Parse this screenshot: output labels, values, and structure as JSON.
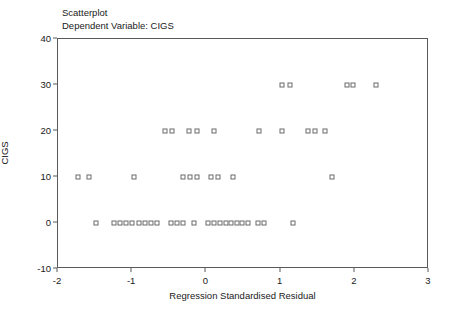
{
  "chart_data": {
    "type": "scatter",
    "title": "Scatterplot",
    "subtitle": "Dependent Variable: CIGS",
    "xlabel": "Regression Standardised Residual",
    "ylabel": "CIGS",
    "xlim": [
      -2,
      3
    ],
    "ylim": [
      -10,
      40
    ],
    "xticks": [
      -2,
      -1,
      0,
      1,
      2,
      3
    ],
    "xticklabels": [
      "-2",
      "-1",
      "0",
      "1",
      "2",
      "3"
    ],
    "yticks": [
      -10,
      0,
      10,
      20,
      30,
      40
    ],
    "yticklabels": [
      "-10",
      "0",
      "10",
      "20",
      "30",
      "40"
    ],
    "grid": false,
    "legend": null,
    "marker": "open-square",
    "marker_color": "#6b6b6b",
    "series": [
      {
        "name": "CIGS vs Regression Standardised Residual",
        "points": [
          [
            1.02,
            30
          ],
          [
            1.12,
            30
          ],
          [
            1.89,
            30
          ],
          [
            1.98,
            30
          ],
          [
            2.28,
            30
          ],
          [
            -0.56,
            20
          ],
          [
            -0.47,
            20
          ],
          [
            -0.24,
            20
          ],
          [
            -0.13,
            20
          ],
          [
            0.1,
            20
          ],
          [
            0.71,
            20
          ],
          [
            1.02,
            20
          ],
          [
            1.37,
            20
          ],
          [
            1.46,
            20
          ],
          [
            1.6,
            20
          ],
          [
            -1.73,
            10
          ],
          [
            -1.58,
            10
          ],
          [
            -0.98,
            10
          ],
          [
            -0.32,
            10
          ],
          [
            -0.22,
            10
          ],
          [
            -0.13,
            10
          ],
          [
            0.06,
            10
          ],
          [
            0.16,
            10
          ],
          [
            0.36,
            10
          ],
          [
            1.69,
            10
          ],
          [
            -1.49,
            0
          ],
          [
            -1.25,
            0
          ],
          [
            -1.17,
            0
          ],
          [
            -1.09,
            0
          ],
          [
            -1.0,
            0
          ],
          [
            -0.91,
            0
          ],
          [
            -0.83,
            0
          ],
          [
            -0.75,
            0
          ],
          [
            -0.67,
            0
          ],
          [
            -0.48,
            0
          ],
          [
            -0.4,
            0
          ],
          [
            -0.32,
            0
          ],
          [
            -0.17,
            0
          ],
          [
            0.02,
            0
          ],
          [
            0.1,
            0
          ],
          [
            0.18,
            0
          ],
          [
            0.26,
            0
          ],
          [
            0.33,
            0
          ],
          [
            0.41,
            0
          ],
          [
            0.48,
            0
          ],
          [
            0.56,
            0
          ],
          [
            0.7,
            0
          ],
          [
            0.78,
            0
          ],
          [
            1.17,
            0
          ]
        ]
      }
    ]
  }
}
